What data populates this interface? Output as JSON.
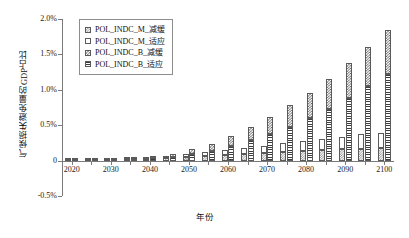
{
  "chart_data": {
    "type": "bar",
    "stacked": true,
    "title": "",
    "xlabel": "年份",
    "ylabel": "气候损失避免量的GDP占比",
    "ylim": [
      -0.5,
      2.0
    ],
    "yticks": [
      "2.0%",
      "1.5%",
      "1.0%",
      "0.5%",
      "0",
      "-0.5%"
    ],
    "ytick_values": [
      2.0,
      1.5,
      1.0,
      0.5,
      0,
      -0.5
    ],
    "grid": false,
    "legend_position": "top-left-inside",
    "categories": [
      "2020",
      "2025",
      "2030",
      "2035",
      "2040",
      "2045",
      "2050",
      "2055",
      "2060",
      "2065",
      "2070",
      "2075",
      "2080",
      "2085",
      "2090",
      "2095",
      "2100"
    ],
    "xtick_labels": [
      "2020",
      "2030",
      "2040",
      "2050",
      "2060",
      "2070",
      "2080",
      "2090",
      "2100"
    ],
    "series": [
      {
        "name": "POL_INDC_M_减缓",
        "pattern": "checker-light",
        "values": [
          0.005,
          0.008,
          0.012,
          0.018,
          0.025,
          0.035,
          0.05,
          0.065,
          0.08,
          0.095,
          0.11,
          0.125,
          0.14,
          0.15,
          0.16,
          0.17,
          0.18
        ]
      },
      {
        "name": "POL_INDC_M_适应",
        "pattern": "blank",
        "values": [
          0.003,
          0.005,
          0.008,
          0.012,
          0.018,
          0.025,
          0.04,
          0.055,
          0.07,
          0.085,
          0.1,
          0.12,
          0.14,
          0.16,
          0.18,
          0.2,
          0.21
        ]
      },
      {
        "name": "POL_INDC_B_减缓",
        "pattern": "checker",
        "values": [
          0.004,
          0.007,
          0.012,
          0.02,
          0.03,
          0.045,
          0.07,
          0.1,
          0.14,
          0.19,
          0.24,
          0.3,
          0.36,
          0.43,
          0.5,
          0.56,
          0.62
        ]
      },
      {
        "name": "POL_INDC_B_适应",
        "pattern": "hlines",
        "values": [
          0.004,
          0.008,
          0.014,
          0.022,
          0.035,
          0.055,
          0.09,
          0.14,
          0.21,
          0.29,
          0.38,
          0.48,
          0.6,
          0.73,
          0.88,
          1.05,
          1.23
        ]
      }
    ]
  },
  "legend": {
    "items": [
      {
        "label": "POL_INDC_M_减缓",
        "pattern": "checker-light"
      },
      {
        "label": "POL_INDC_M_适应",
        "pattern": "blank"
      },
      {
        "label": "POL_INDC_B_减缓",
        "pattern": "checker"
      },
      {
        "label": "POL_INDC_B_适应",
        "pattern": "hlines"
      }
    ]
  },
  "colors": {
    "axis": "#7a7a7a",
    "text": "#111111",
    "pattern_dark": "#3d3d3d",
    "pattern_mid": "#5e5e5e",
    "pattern_light": "#8a8a8a",
    "background": "#ffffff"
  }
}
